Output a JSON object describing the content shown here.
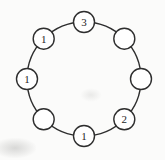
{
  "diagram": {
    "type": "ring-of-nodes",
    "background_color": "#fbfbfa",
    "stroke_color": "#2e2e2e",
    "node_fill": "#ffffff",
    "label_color": "#262626",
    "center": {
      "x": 84,
      "y": 79
    },
    "ring_radius": 57,
    "node_radius": 10.5,
    "stroke_width": 1.4,
    "nodes": [
      {
        "id": "top",
        "angle_deg": 90,
        "label": "3"
      },
      {
        "id": "upper-right",
        "angle_deg": 45,
        "label": ""
      },
      {
        "id": "right",
        "angle_deg": 0,
        "label": ""
      },
      {
        "id": "lower-right",
        "angle_deg": -45,
        "label": "2"
      },
      {
        "id": "bottom",
        "angle_deg": -90,
        "label": "1"
      },
      {
        "id": "lower-left",
        "angle_deg": -135,
        "label": ""
      },
      {
        "id": "left",
        "angle_deg": 180,
        "label": "1"
      },
      {
        "id": "upper-left",
        "angle_deg": 135,
        "label": "1"
      }
    ]
  }
}
